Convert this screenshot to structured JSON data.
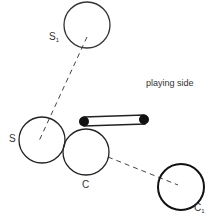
{
  "diagram": {
    "labels": {
      "s1": "S",
      "s1_sub": "1",
      "s": "S",
      "c": "C",
      "c1": "C",
      "c1_sub": "1",
      "playing_side": "playing side"
    },
    "colors": {
      "stroke": "#222222",
      "text": "#333333",
      "background": "#ffffff"
    }
  }
}
